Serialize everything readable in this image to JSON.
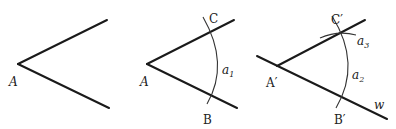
{
  "figures": [
    {
      "id": "original-angle",
      "labels": {
        "vertex": "A"
      }
    },
    {
      "id": "angle-with-arc",
      "labels": {
        "vertex": "A",
        "upper_point": "C",
        "lower_point": "B",
        "arc": "a",
        "arc_sub": "1"
      }
    },
    {
      "id": "copied-angle",
      "labels": {
        "vertex": "A′",
        "upper_point": "C′",
        "lower_point": "B′",
        "arc": "a",
        "arc_sub": "2",
        "small_arc": "a",
        "small_arc_sub": "3",
        "ray": "w"
      }
    }
  ],
  "colors": {
    "line": "#1a1a1a",
    "arc": "#333333",
    "text": "#222222",
    "background": "#ffffff"
  }
}
